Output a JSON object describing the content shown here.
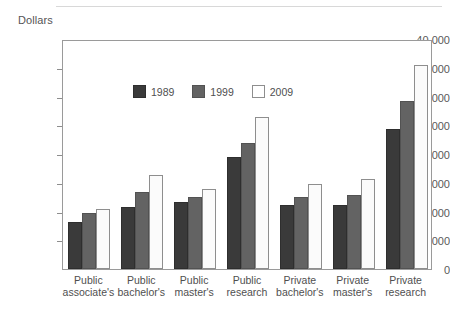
{
  "axis_title": "Dollars",
  "legend": {
    "items": [
      {
        "label": "1989",
        "color": "#3a3a3a"
      },
      {
        "label": "1999",
        "color": "#636363"
      },
      {
        "label": "2009",
        "color": "#ffffff"
      }
    ]
  },
  "y_ticks": [
    "0",
    "5,000",
    "10,000",
    "15,000",
    "20,000",
    "25,000",
    "30,000",
    "35,000",
    "40,000"
  ],
  "categories_lines": [
    {
      "l1": "Public",
      "l2": "associate's"
    },
    {
      "l1": "Public",
      "l2": "bachelor's"
    },
    {
      "l1": "Public",
      "l2": "master's"
    },
    {
      "l1": "Public",
      "l2": "research"
    },
    {
      "l1": "Private",
      "l2": "bachelor's"
    },
    {
      "l1": "Private",
      "l2": "master's"
    },
    {
      "l1": "Private",
      "l2": "research"
    }
  ],
  "chart_data": {
    "type": "bar",
    "title": "",
    "xlabel": "",
    "ylabel": "Dollars",
    "ylim": [
      0,
      40000
    ],
    "ytick_step": 5000,
    "grid": false,
    "legend_position": "top-left inside plot",
    "categories": [
      "Public associate's",
      "Public bachelor's",
      "Public master's",
      "Public research",
      "Private bachelor's",
      "Private master's",
      "Private research"
    ],
    "series": [
      {
        "name": "1989",
        "values": [
          8200,
          10800,
          11700,
          19400,
          11200,
          11100,
          24400
        ]
      },
      {
        "name": "1999",
        "values": [
          9800,
          13400,
          12600,
          22000,
          12500,
          12900,
          29300
        ]
      },
      {
        "name": "2009",
        "values": [
          10500,
          16400,
          14000,
          26400,
          14800,
          15600,
          35500
        ]
      }
    ]
  }
}
